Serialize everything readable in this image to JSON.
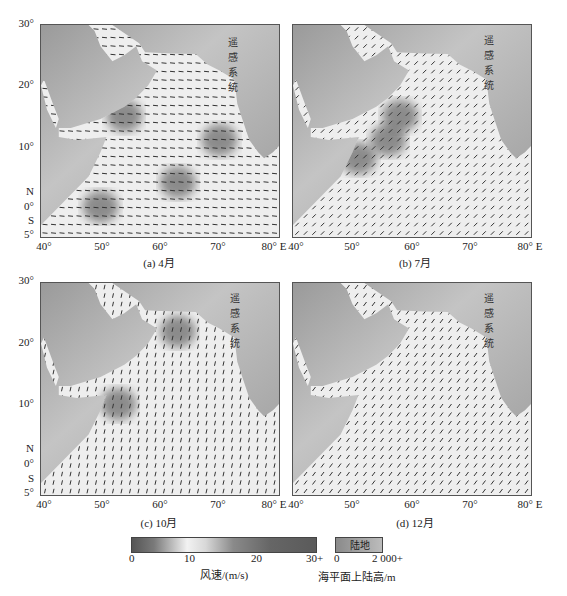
{
  "chart_data": {
    "type": "map",
    "title": "",
    "panels": [
      {
        "id": "a",
        "caption": "(a) 4月",
        "month": "4月",
        "watermark": "遥感系统",
        "high_wind_regions": [
          {
            "lon": 50,
            "lat": 0
          },
          {
            "lon": 54,
            "lat": 15
          },
          {
            "lon": 70,
            "lat": 11
          },
          {
            "lon": 63,
            "lat": 4
          }
        ]
      },
      {
        "id": "b",
        "caption": "(b) 7月",
        "month": "7月",
        "watermark": "遥感系统",
        "high_wind_regions": [
          {
            "lon": 51,
            "lat": 8
          },
          {
            "lon": 56,
            "lat": 11
          },
          {
            "lon": 58,
            "lat": 15
          }
        ]
      },
      {
        "id": "c",
        "caption": "(c) 10月",
        "month": "10月",
        "watermark": "遥感系统",
        "high_wind_regions": [
          {
            "lon": 63,
            "lat": 22
          },
          {
            "lon": 53,
            "lat": 10
          }
        ]
      },
      {
        "id": "d",
        "caption": "(d) 12月",
        "month": "12月",
        "watermark": "遥感系统",
        "high_wind_regions": []
      }
    ],
    "x_ticks": [
      "40°",
      "50°",
      "60°",
      "70°",
      "80° E"
    ],
    "y_ticks": [
      "30°",
      "20°",
      "10°",
      "N",
      "0°",
      "S",
      "5°"
    ],
    "xlim": [
      40,
      80
    ],
    "ylim": [
      -5,
      30
    ],
    "colorbar": {
      "label": "风速/(m/s)",
      "ticks": [
        "0",
        "10",
        "20",
        "30+"
      ],
      "range": [
        0,
        30
      ]
    },
    "land_legend": {
      "box_label": "陆地",
      "label": "海平面上陆高/m",
      "ticks": [
        "0",
        "2 000+"
      ]
    }
  },
  "colors": {
    "land": "#9a9a9a",
    "land_light": "#c4c4c4",
    "ocean_low": "#eeeeee",
    "ocean_high": "#6a6a6a",
    "arrow": "#333333"
  }
}
